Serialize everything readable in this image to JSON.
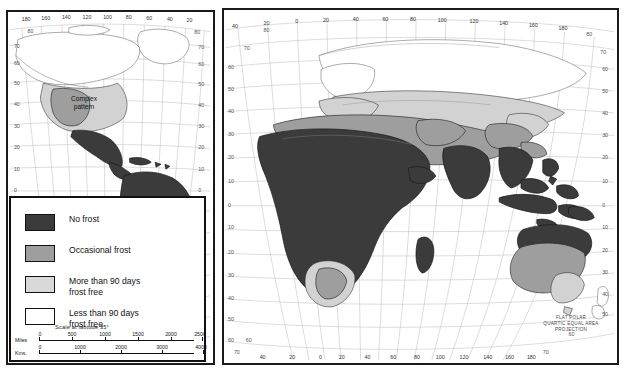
{
  "map": {
    "title": "World Frost Distribution Map",
    "projection_note": "FLAT POLAR\nQUARTIC EQUAL AREA\nPROJECTION",
    "inset_label": "Complex\npattern",
    "panels": [
      {
        "name": "americas-panel",
        "label": "Western Hemisphere"
      },
      {
        "name": "eurasia-africa-panel",
        "label": "Eastern Hemisphere"
      }
    ]
  },
  "legend": {
    "items": [
      {
        "swatch": "no-frost",
        "label": "No frost",
        "color": "#3b3b3b"
      },
      {
        "swatch": "occasional-frost",
        "label": "Occasional frost",
        "color": "#9e9e9e"
      },
      {
        "swatch": "more-90-days",
        "label": "More than 90 days\nfrost free",
        "color": "#d9d9d9"
      },
      {
        "swatch": "less-90-days",
        "label": "Less than 90 days\nfrost free",
        "color": "#ffffff"
      }
    ]
  },
  "scale": {
    "title": "Scale at latitude 35°",
    "miles": {
      "unit": "Miles",
      "ticks": [
        "0",
        "500",
        "1000",
        "1500",
        "2000",
        "2500"
      ]
    },
    "kms": {
      "unit": "Kms.",
      "ticks": [
        "0",
        "1000",
        "2000",
        "3000",
        "4000"
      ]
    }
  },
  "graticule": {
    "left_panel": {
      "top_longitudes": [
        "180",
        "160",
        "140",
        "120",
        "100",
        "80",
        "60",
        "40",
        "20"
      ],
      "bottom_longitudes": [
        "100",
        "80",
        "60",
        "40",
        "20"
      ],
      "left_latitudes": [
        "80",
        "70",
        "60",
        "50",
        "40",
        "30",
        "20",
        "10",
        "0",
        "10",
        "20",
        "30",
        "40",
        "50",
        "60",
        "70"
      ],
      "right_latitudes": [
        "80",
        "70",
        "60",
        "50",
        "40",
        "30",
        "20",
        "10",
        "0",
        "10",
        "20",
        "30",
        "40",
        "50",
        "60",
        "70"
      ]
    },
    "right_panel": {
      "top_longitudes": [
        "40",
        "20",
        "0",
        "20",
        "40",
        "60",
        "80",
        "100",
        "120",
        "140",
        "160",
        "180"
      ],
      "bottom_longitudes": [
        "40",
        "20",
        "0",
        "20",
        "40",
        "60",
        "80",
        "100",
        "120",
        "140",
        "160",
        "180"
      ],
      "top_latitudes": [
        "80",
        "70"
      ],
      "left_latitudes": [
        "60",
        "50",
        "40",
        "30",
        "20",
        "10",
        "0",
        "10",
        "20",
        "30",
        "40",
        "50",
        "60",
        "70"
      ],
      "right_latitudes": [
        "60",
        "50",
        "40",
        "30",
        "20",
        "10",
        "0",
        "10",
        "20",
        "30",
        "40",
        "50",
        "60",
        "70"
      ]
    }
  }
}
